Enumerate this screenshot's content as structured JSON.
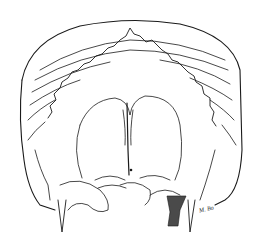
{
  "image": {
    "subject": "skull-line-drawing",
    "style": "black ink engraving on white",
    "colors": {
      "ink": "#1a1a1a",
      "shadow_fill": "#4a4a4a",
      "background": "#ffffff"
    }
  },
  "signature": {
    "text": "M. Bo"
  }
}
